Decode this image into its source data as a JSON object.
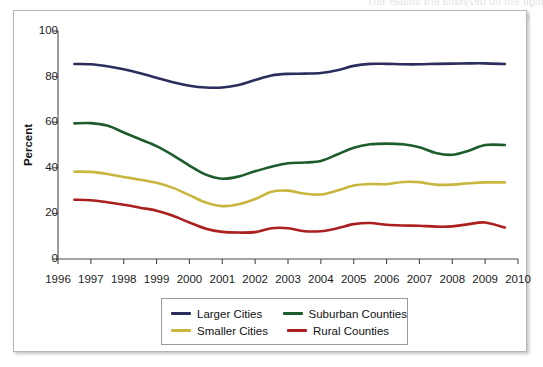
{
  "figure": {
    "bleed_top_text": "ihgir eht no dezylana era stluser ehT",
    "bleed_mid_text": "ni detneserp era trahc eht ni dedulcni seires ehT\nstniop atad launna"
  },
  "chart_data": {
    "type": "line",
    "title": "",
    "xlabel": "",
    "ylabel": "Percent",
    "xlim": [
      1996,
      2010
    ],
    "ylim": [
      0,
      100
    ],
    "grid": false,
    "legend_position": "bottom",
    "x_ticks": [
      1996,
      1997,
      1998,
      1999,
      2000,
      2001,
      2002,
      2003,
      2004,
      2005,
      2006,
      2007,
      2008,
      2009,
      2010
    ],
    "y_ticks": [
      0,
      20,
      40,
      60,
      80,
      100
    ],
    "x": [
      1996.5,
      1997,
      1997.5,
      1998,
      1998.5,
      1999,
      1999.5,
      2000,
      2000.5,
      2001,
      2001.5,
      2002,
      2002.5,
      2003,
      2003.5,
      2004,
      2004.5,
      2005,
      2005.5,
      2006,
      2006.5,
      2007,
      2007.5,
      2008,
      2008.5,
      2009,
      2009.6
    ],
    "series": [
      {
        "name": "Larger Cities",
        "color": "#2b2d5c",
        "values": [
          85.5,
          85.4,
          84.5,
          83.2,
          81.5,
          79.5,
          77.5,
          76.0,
          75.2,
          75.2,
          76.3,
          78.5,
          80.5,
          81.2,
          81.3,
          81.6,
          82.8,
          84.7,
          85.6,
          85.6,
          85.4,
          85.4,
          85.6,
          85.7,
          85.8,
          85.8,
          85.5
        ]
      },
      {
        "name": "Suburban Counties",
        "color": "#1d5c2d",
        "values": [
          59.5,
          59.6,
          58.5,
          55.5,
          52.5,
          49.5,
          45.5,
          41.0,
          37.0,
          35.2,
          36.2,
          38.5,
          40.5,
          42.0,
          42.3,
          43.0,
          45.8,
          48.8,
          50.3,
          50.6,
          50.3,
          49.0,
          46.5,
          45.7,
          47.5,
          50.0,
          50.0
        ]
      },
      {
        "name": "Smaller Cities",
        "color": "#c9b63e",
        "values": [
          38.3,
          38.2,
          37.3,
          36.0,
          34.8,
          33.4,
          31.2,
          28.0,
          24.8,
          23.2,
          24.0,
          26.3,
          29.5,
          30.0,
          28.7,
          28.3,
          30.0,
          32.2,
          32.9,
          32.8,
          33.8,
          33.7,
          32.6,
          32.6,
          33.2,
          33.6,
          33.6
        ]
      },
      {
        "name": "Rural Counties",
        "color": "#ac1f1f",
        "values": [
          26.0,
          25.8,
          24.9,
          23.8,
          22.5,
          21.2,
          19.0,
          16.0,
          13.3,
          11.9,
          11.6,
          11.8,
          13.5,
          13.5,
          12.2,
          12.2,
          13.5,
          15.3,
          15.8,
          15.0,
          14.7,
          14.6,
          14.2,
          14.3,
          15.3,
          16.0,
          13.8
        ]
      }
    ]
  },
  "legend": {
    "entries": [
      {
        "label": "Larger Cities",
        "color": "#2b2d5c"
      },
      {
        "label": "Suburban Counties",
        "color": "#1d5c2d"
      },
      {
        "label": "Smaller Cities",
        "color": "#c9b63e"
      },
      {
        "label": "Rural Counties",
        "color": "#ac1f1f"
      }
    ]
  }
}
